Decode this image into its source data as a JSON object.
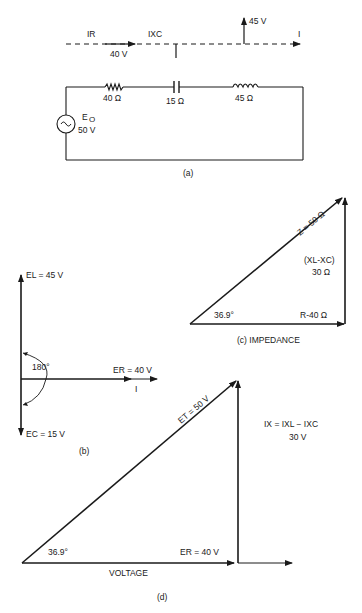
{
  "figure_a": {
    "caption": "(a)",
    "phasor_line": {
      "ir_label": "IR",
      "ir_value": "40 V",
      "ixc_label": "IXC",
      "xl_value": "45 V",
      "i_label": "I"
    },
    "circuit": {
      "resistor": "40 Ω",
      "capacitor": "15 Ω",
      "inductor": "45 Ω",
      "source_label": "E",
      "source_subscript": "O",
      "source_value": "50 V"
    }
  },
  "figure_b": {
    "caption": "(b)",
    "el_label": "EL = 45 V",
    "er_label": "ER = 40 V",
    "ec_label": "EC = 15 V",
    "i_label": "I",
    "angle_label": "180°"
  },
  "figure_c": {
    "caption": "(c)  IMPEDANCE",
    "z_label": "Z = 50 Ω",
    "x_label_1": "(XL-XC)",
    "x_label_2": "30 Ω",
    "r_label": "R-40 Ω",
    "angle_label": "36.9°"
  },
  "figure_d": {
    "caption": "(d)",
    "et_label": "ET = 50 V",
    "er_label": "ER = 40 V",
    "ix_label_1": "IX = IXL − IXC",
    "ix_label_2": "30 V",
    "angle_label": "36.9°",
    "axis_label": "VOLTAGE"
  }
}
